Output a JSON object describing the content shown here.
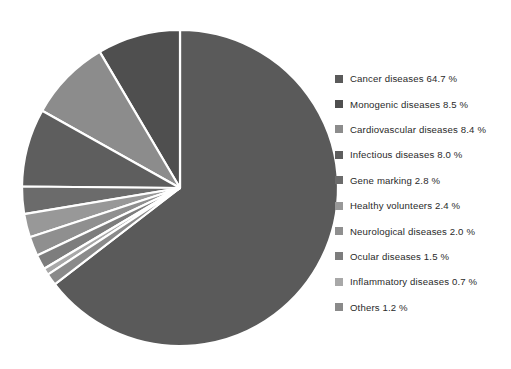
{
  "chart_data": {
    "type": "pie",
    "title": "",
    "subtitle": "",
    "xlabel": "",
    "ylabel": "",
    "grid": false,
    "legend_position": "right",
    "units": "%",
    "start_angle_deg": 0,
    "first_slice_direction": "clockwise",
    "remaining_slices_direction": "counter-clockwise",
    "categories": [
      "Cancer diseases",
      "Monogenic diseases",
      "Cardiovascular diseases",
      "Infectious diseases",
      "Gene marking",
      "Healthy volunteers",
      "Neurological diseases",
      "Ocular diseases",
      "Inflammatory diseases",
      "Others"
    ],
    "values": [
      64.7,
      8.5,
      8.4,
      8.0,
      2.8,
      2.4,
      2.0,
      1.5,
      0.7,
      1.2
    ],
    "value_labels": [
      "64.7 %",
      "8.5 %",
      "8.4 %",
      "8.0 %",
      "2.8 %",
      "2.4 %",
      "2.0 %",
      "1.5 %",
      "0.7 %",
      "1.2 %"
    ],
    "colors": [
      "#5a5a5a",
      "#4f4f4f",
      "#8c8c8c",
      "#5e5e5e",
      "#6b6b6b",
      "#989898",
      "#8f8f8f",
      "#7d7d7d",
      "#a8a8a8",
      "#8a8a8a"
    ],
    "slice_separator_color": "#ffffff"
  },
  "legend": {
    "items": [
      {
        "label": "Cancer diseases 64.7 %",
        "color": "#5a5a5a"
      },
      {
        "label": "Monogenic diseases 8.5 %",
        "color": "#4f4f4f"
      },
      {
        "label": "Cardiovascular diseases 8.4 %",
        "color": "#8c8c8c"
      },
      {
        "label": "Infectious diseases 8.0 %",
        "color": "#5e5e5e"
      },
      {
        "label": "Gene marking 2.8 %",
        "color": "#6b6b6b"
      },
      {
        "label": "Healthy volunteers 2.4 %",
        "color": "#989898"
      },
      {
        "label": "Neurological diseases 2.0 %",
        "color": "#8f8f8f"
      },
      {
        "label": "Ocular diseases 1.5 %",
        "color": "#7d7d7d"
      },
      {
        "label": "Inflammatory diseases 0.7 %",
        "color": "#a8a8a8"
      },
      {
        "label": "Others 1.2 %",
        "color": "#8a8a8a"
      }
    ]
  },
  "geometry": {
    "center_x": 180,
    "center_y": 188,
    "radius": 158
  }
}
